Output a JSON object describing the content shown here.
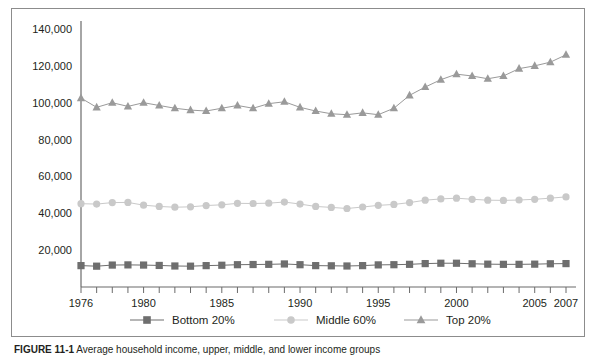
{
  "figure": {
    "caption_label": "FIGURE 11-1",
    "caption_text": "Average household income, upper, middle, and lower income groups"
  },
  "chart_data": {
    "type": "line",
    "title": "",
    "xlabel": "",
    "ylabel": "",
    "grid": false,
    "legend_position": "bottom",
    "xlim": [
      1976,
      2007
    ],
    "ylim": [
      0,
      140000
    ],
    "ytick_values": [
      20000,
      40000,
      60000,
      80000,
      100000,
      120000,
      140000
    ],
    "ytick_labels": [
      "20,000",
      "40,000",
      "60,000",
      "80,000",
      "100,000",
      "120,000",
      "140,000"
    ],
    "x": [
      1976,
      1977,
      1978,
      1979,
      1980,
      1981,
      1982,
      1983,
      1984,
      1985,
      1986,
      1987,
      1988,
      1989,
      1990,
      1991,
      1992,
      1993,
      1994,
      1995,
      1996,
      1997,
      1998,
      1999,
      2000,
      2001,
      2002,
      2003,
      2004,
      2005,
      2006,
      2007
    ],
    "xtick_labels": [
      {
        "value": 1976,
        "label": "1976"
      },
      {
        "value": 1980,
        "label": "1980"
      },
      {
        "value": 1985,
        "label": "1985"
      },
      {
        "value": 1990,
        "label": "1990"
      },
      {
        "value": 1995,
        "label": "1995"
      },
      {
        "value": 2000,
        "label": "2000"
      },
      {
        "value": 2005,
        "label": "2005"
      },
      {
        "value": 2007,
        "label": "2007"
      }
    ],
    "series": [
      {
        "name": "Bottom 20%",
        "marker": "square",
        "color": "#6e6e6e",
        "values": [
          11600,
          11300,
          11900,
          12000,
          11900,
          11700,
          11400,
          11300,
          11600,
          11800,
          12100,
          12200,
          12300,
          12500,
          12100,
          11600,
          11500,
          11400,
          11600,
          12000,
          12100,
          12300,
          12700,
          12900,
          12900,
          12600,
          12400,
          12300,
          12300,
          12400,
          12600,
          12700
        ]
      },
      {
        "name": "Middle 60%",
        "marker": "circle",
        "color": "#c9c9c9",
        "values": [
          45200,
          45000,
          45800,
          45900,
          44400,
          43700,
          43300,
          43500,
          44200,
          44600,
          45400,
          45300,
          45500,
          46100,
          45000,
          43700,
          43200,
          42600,
          43400,
          44300,
          44800,
          45800,
          47100,
          47800,
          48200,
          47600,
          47100,
          47000,
          47200,
          47600,
          48200,
          48900
        ]
      },
      {
        "name": "Top 20%",
        "marker": "triangle",
        "color": "#9a9a9a",
        "values": [
          102500,
          97500,
          100000,
          98000,
          100000,
          98500,
          97000,
          96000,
          95500,
          97000,
          98500,
          97000,
          99500,
          100500,
          97500,
          95500,
          94000,
          93500,
          94500,
          93500,
          97000,
          104000,
          108500,
          112500,
          115500,
          114500,
          113000,
          114500,
          118500,
          120000,
          122000,
          126000
        ]
      }
    ]
  }
}
